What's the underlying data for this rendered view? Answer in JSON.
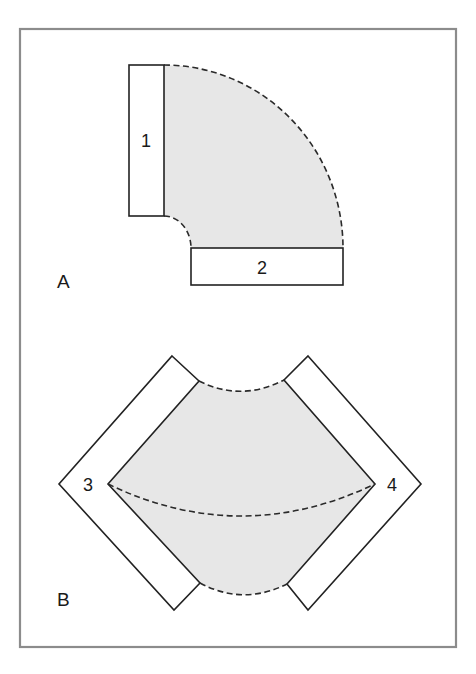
{
  "figure": {
    "panels": [
      {
        "id": "A",
        "label": "A",
        "description": "90-degree elbow: two straight flanges joined by shaded quarter-ring with dashed arcs",
        "parts": [
          {
            "id": "1",
            "label": "1",
            "orientation": "vertical"
          },
          {
            "id": "2",
            "label": "2",
            "orientation": "horizontal"
          }
        ]
      },
      {
        "id": "B",
        "label": "B",
        "description": "Two flanges at 45-degree tilts joined by shaded region with dashed arcs; dashed curve connects points 3 and 4",
        "parts": [
          {
            "id": "3",
            "label": "3",
            "orientation": "diagonal-left"
          },
          {
            "id": "4",
            "label": "4",
            "orientation": "diagonal-right"
          }
        ]
      }
    ],
    "colors": {
      "frame": "#8c8c8c",
      "shading": "#e7e7e7",
      "line": "#222222",
      "background": "#ffffff"
    }
  }
}
